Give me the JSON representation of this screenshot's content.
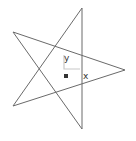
{
  "diagram": {
    "type": "pentagram",
    "stroke_color": "#6a6a6a",
    "marker_color": "#c8c8c8",
    "vertices": {
      "top": [
        82,
        8
      ],
      "left_top": [
        13,
        32
      ],
      "right": [
        125,
        70
      ],
      "left_bottom": [
        13,
        106
      ],
      "bottom": [
        82,
        129
      ]
    },
    "labels": {
      "y": "y",
      "x": "x"
    },
    "point_marker": [
      66,
      76
    ]
  }
}
